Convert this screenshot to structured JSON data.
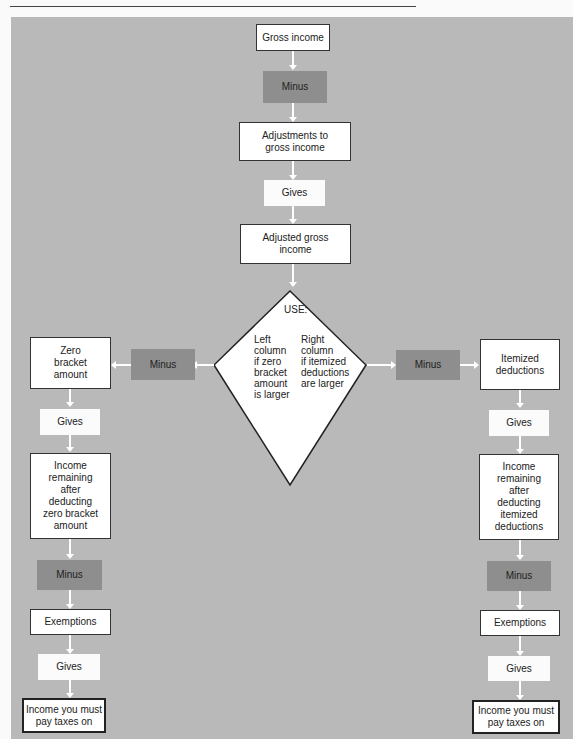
{
  "center": {
    "gross_income": "Gross income",
    "minus": "Minus",
    "adjustments": "Adjustments to\ngross income",
    "gives": "Gives",
    "agi": "Adjusted gross\nincome"
  },
  "decision": {
    "title": "USE:",
    "left_text": "Left\ncolumn\nif zero\nbracket\namount\nis larger",
    "right_text": "Right\ncolumn\nif itemized\ndeductions\nare larger"
  },
  "left_column": {
    "minus_side": "Minus",
    "deduction": "Zero\nbracket\namount",
    "gives_1": "Gives",
    "remaining": "Income\nremaining\nafter\ndeducting\nzero bracket\namount",
    "minus_2": "Minus",
    "exemptions": "Exemptions",
    "gives_2": "Gives",
    "result": "Income you must\npay taxes on"
  },
  "right_column": {
    "minus_side": "Minus",
    "deduction": "Itemized\ndeductions",
    "gives_1": "Gives",
    "remaining": "Income\nremaining\nafter\ndeducting\nitemized\ndeductions",
    "minus_2": "Minus",
    "exemptions": "Exemptions",
    "gives_2": "Gives",
    "result": "Income you must\npay taxes on"
  },
  "colors": {
    "panel": "#b9b9b9",
    "operator_dark": "#8e8e8e",
    "box_white": "#ffffff",
    "connector": "#ffffff"
  }
}
